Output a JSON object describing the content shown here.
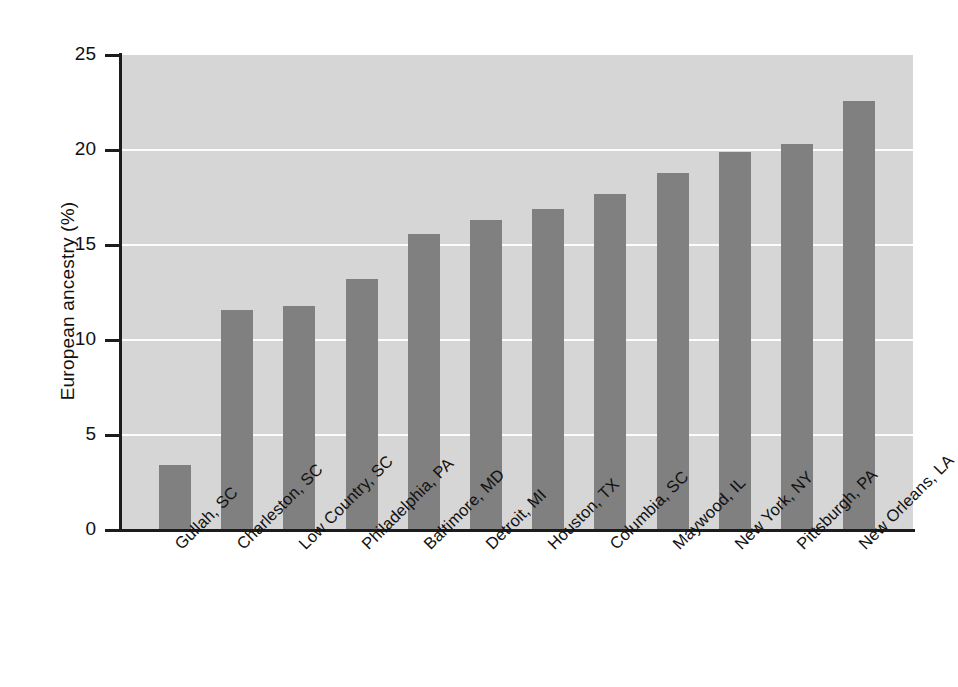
{
  "chart_data": {
    "type": "bar",
    "title": "",
    "xlabel": "",
    "ylabel": "European ancestry (%)",
    "ylim": [
      0,
      25
    ],
    "yticks": [
      0,
      5,
      10,
      15,
      20,
      25
    ],
    "ytick_labels": [
      "0",
      "5",
      "10",
      "15",
      "20",
      "25"
    ],
    "grid": true,
    "legend": "none",
    "bar_color": "#808080",
    "plot_background": "#d6d6d6",
    "gridline_color": "#fdfdfd",
    "axis_color": "#1c1c1c",
    "categories": [
      "Gullah, SC",
      "Charleston, SC",
      "Low Country, SC",
      "Philadelphia, PA",
      "Baltimore, MD",
      "Detroit, MI",
      "Houston, TX",
      "Columbia, SC",
      "Maywood, IL",
      "New York, NY",
      "Pittsburgh, PA",
      "New Orleans, LA"
    ],
    "values": [
      3.4,
      11.6,
      11.8,
      13.2,
      15.6,
      16.3,
      16.9,
      17.7,
      18.8,
      19.9,
      20.3,
      22.6
    ]
  }
}
